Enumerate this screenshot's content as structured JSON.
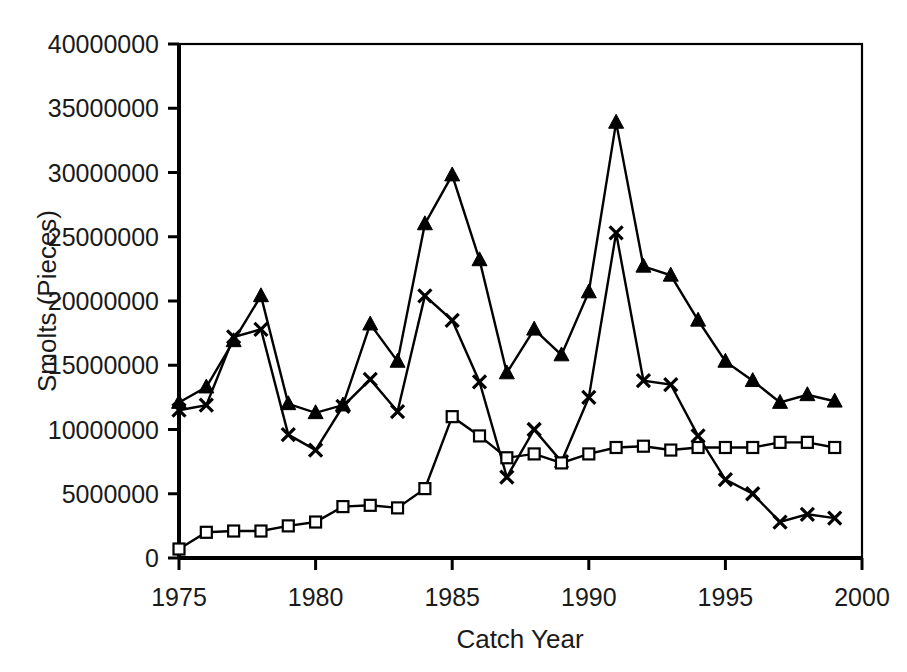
{
  "chart_data": {
    "type": "line",
    "title": "",
    "xlabel": "Catch Year",
    "ylabel": "Smolts (Pieces)",
    "xlim": [
      1975,
      2000
    ],
    "ylim": [
      0,
      40000000
    ],
    "xticks": [
      "1975",
      "1980",
      "1985",
      "1990",
      "1995",
      "2000"
    ],
    "xtick_values": [
      1975,
      1980,
      1985,
      1990,
      1995,
      2000
    ],
    "yticks": [
      "0",
      "5000000",
      "10000000",
      "15000000",
      "20000000",
      "25000000",
      "30000000",
      "35000000",
      "40000000"
    ],
    "ytick_values": [
      0,
      5000000,
      10000000,
      15000000,
      20000000,
      25000000,
      30000000,
      35000000,
      40000000
    ],
    "grid": false,
    "legend": "none",
    "x": [
      1975,
      1976,
      1977,
      1978,
      1979,
      1980,
      1981,
      1982,
      1983,
      1984,
      1985,
      1986,
      1987,
      1988,
      1989,
      1990,
      1991,
      1992,
      1993,
      1994,
      1995,
      1996,
      1997,
      1998,
      1999
    ],
    "series": [
      {
        "name": "Triangle series",
        "marker": "triangle",
        "values": [
          12100000,
          13300000,
          16900000,
          20400000,
          12000000,
          11300000,
          11900000,
          18200000,
          15300000,
          26000000,
          29800000,
          23200000,
          14400000,
          17800000,
          15800000,
          20700000,
          33900000,
          22700000,
          22000000,
          18500000,
          15300000,
          13800000,
          12100000,
          12700000,
          12200000
        ]
      },
      {
        "name": "X series",
        "marker": "x",
        "values": [
          11500000,
          11900000,
          17200000,
          17800000,
          9600000,
          8400000,
          11800000,
          13900000,
          11400000,
          20400000,
          18500000,
          13700000,
          6300000,
          10000000,
          7500000,
          12500000,
          25300000,
          13800000,
          13500000,
          9500000,
          6100000,
          5000000,
          2800000,
          3400000,
          3100000
        ]
      },
      {
        "name": "Square series",
        "marker": "square",
        "values": [
          700000,
          2000000,
          2100000,
          2100000,
          2500000,
          2800000,
          4000000,
          4100000,
          3900000,
          5400000,
          11000000,
          9500000,
          7800000,
          8100000,
          7400000,
          8100000,
          8600000,
          8700000,
          8400000,
          8600000,
          8600000,
          8600000,
          9000000,
          9000000,
          8600000
        ]
      }
    ]
  },
  "plot_geometry": {
    "left": 179,
    "right": 862,
    "top": 44,
    "bottom": 558
  }
}
